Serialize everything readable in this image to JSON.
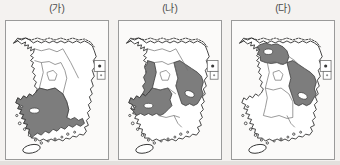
{
  "figure": {
    "title": "",
    "background_color": "#f4f2f0",
    "panel_count": 3
  },
  "panels": [
    {
      "label": "(가)",
      "name": "map-panel-ga",
      "shaded_regions": [
        "전라북도",
        "전라남도",
        "경상남도"
      ],
      "shaded_region_count": 3,
      "unshaded_regions": [
        "경기도",
        "강원도",
        "충청북도",
        "충청남도",
        "경상북도",
        "제주도"
      ]
    },
    {
      "label": "(나)",
      "name": "map-panel-na",
      "shaded_regions": [
        "충청남도",
        "전라북도",
        "경상북도"
      ],
      "shaded_region_count": 3,
      "unshaded_regions": [
        "경기도",
        "강원도",
        "충청북도",
        "전라남도",
        "경상남도",
        "제주도"
      ]
    },
    {
      "label": "(다)",
      "name": "map-panel-da",
      "shaded_regions": [
        "경기도",
        "경상북도"
      ],
      "shaded_region_count": 2,
      "unshaded_regions": [
        "강원도",
        "충청북도",
        "충청남도",
        "전라북도",
        "전라남도",
        "경상남도",
        "제주도"
      ]
    }
  ],
  "legend": {
    "shaded_fill": "#7d7d7d",
    "unshaded_fill": "#ffffff",
    "outline_color": "#2e2e2e",
    "province_border_color": "#6d6d6d",
    "frame_color": "#9a9a9a"
  },
  "map_features": {
    "country": "대한민국",
    "north_border_style": "dotted",
    "inset_boxes": [
      "울릉도",
      "독도"
    ],
    "island_bottom_left": "제주도"
  }
}
